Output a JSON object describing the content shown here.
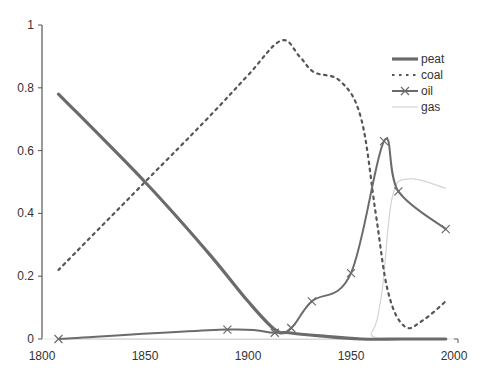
{
  "chart_data": {
    "type": "line",
    "title": "",
    "xlabel": "",
    "ylabel": "",
    "xlim": [
      1800,
      2000
    ],
    "ylim": [
      0,
      1
    ],
    "xticks": [
      1800,
      1850,
      1900,
      1950,
      2000
    ],
    "yticks": [
      0,
      0.2,
      0.4,
      0.6,
      0.8,
      1
    ],
    "ytick_labels": [
      "0",
      "0.2",
      "0.4",
      "0.6",
      "0.8",
      "1"
    ],
    "xtick_labels": [
      "1800",
      "1850",
      "1900",
      "1950",
      "2000"
    ],
    "grid": false,
    "legend_position": "upper right",
    "series": [
      {
        "name": "peat",
        "style": "thick-solid",
        "color": "#6b6b6b",
        "x": [
          1808,
          1850,
          1880,
          1900,
          1913,
          1920,
          1935,
          1955,
          1975,
          1996
        ],
        "values": [
          0.78,
          0.5,
          0.28,
          0.12,
          0.03,
          0.02,
          0.01,
          0.0,
          0.0,
          0.0
        ]
      },
      {
        "name": "coal",
        "style": "dotted",
        "color": "#555555",
        "x": [
          1808,
          1850,
          1880,
          1900,
          1916,
          1925,
          1932,
          1945,
          1955,
          1962,
          1968,
          1976,
          1985,
          1996
        ],
        "values": [
          0.22,
          0.5,
          0.7,
          0.84,
          0.95,
          0.9,
          0.85,
          0.82,
          0.7,
          0.4,
          0.15,
          0.04,
          0.06,
          0.12
        ]
      },
      {
        "name": "oil",
        "style": "solid-x-marker",
        "color": "#6b6b6b",
        "x": [
          1808,
          1890,
          1913,
          1921,
          1931,
          1950,
          1966,
          1973,
          1996
        ],
        "values": [
          0.0,
          0.03,
          0.02,
          0.035,
          0.12,
          0.21,
          0.63,
          0.47,
          0.35
        ]
      },
      {
        "name": "gas",
        "style": "thin-light",
        "color": "#d4d4d4",
        "x": [
          1808,
          1950,
          1960,
          1965,
          1970,
          1978,
          1996
        ],
        "values": [
          0.0,
          0.0,
          0.02,
          0.15,
          0.45,
          0.51,
          0.48
        ]
      }
    ]
  },
  "legend": [
    {
      "label": "peat"
    },
    {
      "label": "coal"
    },
    {
      "label": "oil"
    },
    {
      "label": "gas"
    }
  ]
}
